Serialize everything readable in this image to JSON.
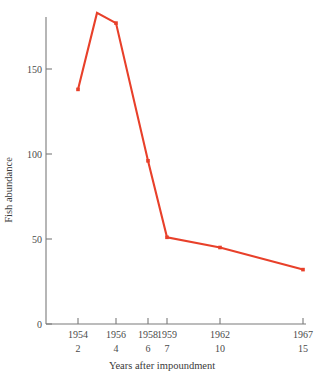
{
  "chart_data": {
    "type": "line",
    "title": "",
    "xlabel": "Years after impoundment",
    "ylabel": "Fish abundance",
    "x": [
      1954,
      1955,
      1956,
      1958,
      1959,
      1962,
      1967
    ],
    "values": [
      138,
      183,
      177,
      96,
      51,
      45,
      32
    ],
    "series": [
      {
        "name": "Fish abundance",
        "color": "#e8402a",
        "values": [
          138,
          183,
          177,
          96,
          51,
          45,
          32
        ]
      }
    ],
    "marked_points": [
      {
        "year": "1954",
        "years_after": "2",
        "value": 138
      },
      {
        "year": "1956",
        "years_after": "4",
        "value": 177
      },
      {
        "year": "1958",
        "years_after": "6",
        "value": 96
      },
      {
        "year": "1959",
        "years_after": "7",
        "value": 51
      },
      {
        "year": "1962",
        "years_after": "10",
        "value": 45
      },
      {
        "year": "1967",
        "years_after": "15",
        "value": 32
      }
    ],
    "peak_vertex": {
      "year": "1955",
      "value": 183
    },
    "xtick_labels_year": [
      "1954",
      "1956",
      "1958",
      "1959",
      "1962",
      "1967"
    ],
    "xtick_labels_years_after": [
      "2",
      "4",
      "6",
      "7",
      "10",
      "15"
    ],
    "xtick_positions_px": [
      78,
      116,
      148,
      167,
      220,
      303
    ],
    "ytick_labels": [
      "0",
      "50",
      "100",
      "150"
    ],
    "ytick_values": [
      0,
      50,
      100,
      150
    ],
    "ylim": [
      0,
      185
    ],
    "grid": false,
    "legend": "none",
    "axis_color": "#7a7a7a",
    "line_color": "#e8402a"
  }
}
